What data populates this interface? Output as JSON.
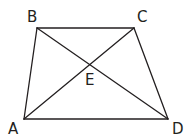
{
  "diagram": {
    "colors": {
      "line": "#231f20",
      "text": "#231f20",
      "background": "#ffffff"
    },
    "points": {
      "A": {
        "label": "A",
        "x": 24,
        "y": 119
      },
      "B": {
        "label": "B",
        "x": 37,
        "y": 28
      },
      "C": {
        "label": "C",
        "x": 134,
        "y": 28
      },
      "D": {
        "label": "D",
        "x": 168,
        "y": 119
      },
      "E": {
        "label": "E",
        "x": 89,
        "y": 64
      }
    },
    "segments": [
      {
        "from": "A",
        "to": "B"
      },
      {
        "from": "B",
        "to": "C"
      },
      {
        "from": "C",
        "to": "D"
      },
      {
        "from": "D",
        "to": "A"
      },
      {
        "from": "A",
        "to": "C"
      },
      {
        "from": "B",
        "to": "D"
      }
    ],
    "labels": {
      "A": "A",
      "B": "B",
      "C": "C",
      "D": "D",
      "E": "E"
    }
  }
}
